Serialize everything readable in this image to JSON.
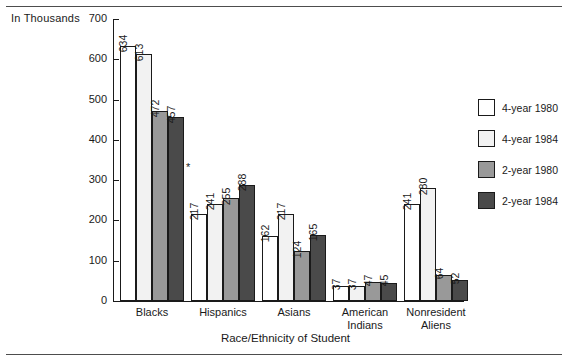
{
  "axis_unit_label": "In Thousands",
  "asterisk_marker": "*",
  "chart_data": {
    "type": "bar",
    "title": "",
    "subtitle": "",
    "xlabel": "Race/Ethnicity of Student",
    "ylabel": "In Thousands",
    "ylim": [
      0,
      700
    ],
    "ytick_values": [
      0,
      100,
      200,
      300,
      400,
      500,
      600,
      700
    ],
    "ytick_labels": [
      "0",
      "100",
      "200",
      "300",
      "400",
      "500",
      "600",
      "700"
    ],
    "grid": false,
    "legend_position": "right",
    "categories": [
      "Blacks",
      "Hispanics",
      "Asians",
      "American Indians",
      "Nonresident Aliens"
    ],
    "category_lines": [
      [
        "Blacks"
      ],
      [
        "Hispanics"
      ],
      [
        "Asians"
      ],
      [
        "American",
        "Indians"
      ],
      [
        "Nonresident",
        "Aliens"
      ]
    ],
    "series": [
      {
        "name": "4-year 1980",
        "color": "#ffffff",
        "values": [
          634,
          217,
          162,
          37,
          241
        ]
      },
      {
        "name": "4-year 1984",
        "color": "#f2f2f2",
        "values": [
          613,
          241,
          217,
          37,
          280
        ]
      },
      {
        "name": "2-year 1980",
        "color": "#999999",
        "values": [
          472,
          255,
          124,
          47,
          64
        ]
      },
      {
        "name": "2-year 1984",
        "color": "#4a4a4a",
        "values": [
          457,
          288,
          165,
          45,
          52
        ]
      }
    ],
    "annotations": [
      {
        "text": "*",
        "near_category": "Hispanics"
      }
    ]
  },
  "legend": {
    "items": [
      {
        "label": "4-year 1980",
        "color": "#ffffff"
      },
      {
        "label": "4-year 1984",
        "color": "#f2f2f2"
      },
      {
        "label": "2-year 1980",
        "color": "#999999"
      },
      {
        "label": "2-year 1984",
        "color": "#4a4a4a"
      }
    ]
  }
}
